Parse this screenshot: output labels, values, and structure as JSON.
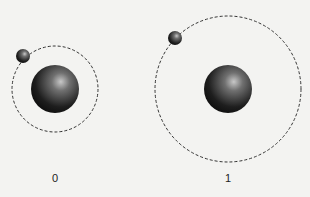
{
  "diagram": {
    "atoms": [
      {
        "label": "0",
        "orbit_radius": 43,
        "cx": 55,
        "cy": 89,
        "electron": {
          "x": 23,
          "y": 56
        }
      },
      {
        "label": "1",
        "orbit_radius": 73,
        "cx": 228,
        "cy": 89,
        "electron": {
          "x": 175,
          "y": 38
        }
      }
    ],
    "colors": {
      "background": "#f3f3f1",
      "orbit": "#333333",
      "nucleus": "#1a1a1a"
    }
  }
}
